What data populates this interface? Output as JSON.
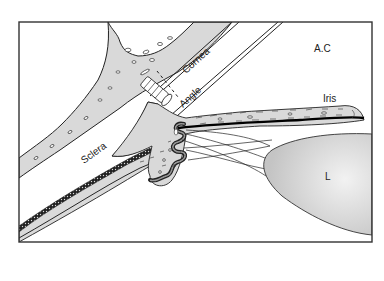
{
  "diagram": {
    "type": "anatomical-cross-section",
    "labels": {
      "anterior_chamber": "A.C",
      "cornea": "Cornea",
      "angle": "Angle",
      "iris": "Iris",
      "sclera": "Sclera",
      "lens": "L"
    },
    "colors": {
      "frame": "#333333",
      "tissue_fill": "#d9d9d9",
      "lens_fill": "#cfcfcf",
      "outline": "#222222",
      "pigment": "#111111",
      "background": "#ffffff"
    }
  }
}
